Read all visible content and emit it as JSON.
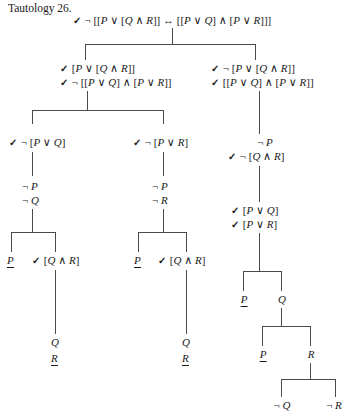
{
  "title": "Tautology 26.",
  "document": {
    "kind": "semantic-tableau-proof",
    "check_mark": "✓",
    "symbols": {
      "negation": "¬",
      "disjunction": "∨",
      "conjunction": "∧",
      "biconditional": "↔"
    },
    "colors": {
      "text": "#1a1a1a",
      "line": "#4a4a4a",
      "background": "#ffffff"
    }
  },
  "nodes": {
    "root": {
      "text": "✓ ¬ [[P ∨ [Q ∧ R]] ↔ [[P ∨ Q] ∧ [P ∨ R]]]",
      "checked": true
    },
    "left_top_1": {
      "text": "✓ [P ∨ [Q ∧ R]]",
      "checked": true
    },
    "left_top_2": {
      "text": "✓ ¬ [[P ∨ Q] ∧ [P ∨ R]]",
      "checked": true
    },
    "right_top_1": {
      "text": "✓ ¬ [P ∨ [Q ∧ R]]",
      "checked": true
    },
    "right_top_2": {
      "text": "✓ [[P ∨ Q] ∧ [P ∨ R]]",
      "checked": true
    },
    "l_left_1": {
      "text": "✓ ¬ [P ∨ Q]",
      "checked": true
    },
    "l_left_2": {
      "text": "¬ P",
      "checked": false
    },
    "l_left_3": {
      "text": "¬ Q",
      "checked": false
    },
    "l_right_1": {
      "text": "✓ ¬ [P ∨ R]",
      "checked": true
    },
    "l_right_2": {
      "text": "¬ P",
      "checked": false
    },
    "l_right_3": {
      "text": "¬ R",
      "checked": false
    },
    "ll_p": {
      "text": "P",
      "closed": true
    },
    "ll_qr": {
      "text": "✓ [Q ∧ R]",
      "checked": true
    },
    "ll_q": {
      "text": "Q",
      "closed": false
    },
    "ll_r": {
      "text": "R",
      "closed": true
    },
    "lr_p": {
      "text": "P",
      "closed": true
    },
    "lr_qr": {
      "text": "✓ [Q ∧ R]",
      "checked": true
    },
    "lr_q": {
      "text": "Q",
      "closed": false
    },
    "lr_r": {
      "text": "R",
      "closed": true
    },
    "r_np": {
      "text": "¬ P",
      "checked": false
    },
    "r_nqr": {
      "text": "✓ ¬ [Q ∧ R]",
      "checked": true
    },
    "r_pq": {
      "text": "✓ [P ∨ Q]",
      "checked": true
    },
    "r_pr": {
      "text": "✓ [P ∨ R]",
      "checked": true
    },
    "r_p": {
      "text": "P",
      "closed": true
    },
    "r_q": {
      "text": "Q",
      "closed": false
    },
    "r_p2": {
      "text": "P",
      "closed": true
    },
    "r_r": {
      "text": "R",
      "closed": false
    },
    "r_nq": {
      "text": "¬ Q",
      "closed": false
    },
    "r_nr": {
      "text": "¬ R",
      "closed": false
    }
  },
  "chart_data": {
    "type": "tree",
    "title": "Tautology 26.",
    "root_formula": "¬ [[P ∨ [Q ∧ R]] ↔ [[P ∨ Q] ∧ [P ∨ R]]]",
    "branch_count": 8,
    "closed_markers": [
      "P",
      "R",
      "P",
      "R",
      "P",
      "P"
    ]
  }
}
